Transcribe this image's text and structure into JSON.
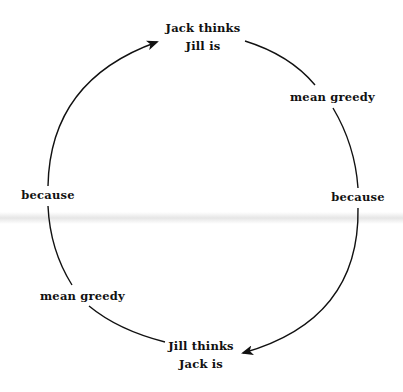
{
  "diagram": {
    "type": "cycle",
    "nodes": {
      "top": {
        "line1": "Jack thinks",
        "line2": "Jill is"
      },
      "bottom": {
        "line1": "Jill thinks",
        "line2": "Jack is"
      }
    },
    "edge_labels": {
      "top_right": "mean greedy",
      "right": "because",
      "bottom_left": "mean greedy",
      "left": "because"
    },
    "arrows": [
      {
        "from": "left",
        "to": "top",
        "direction": "clockwise"
      },
      {
        "from": "right",
        "to": "bottom",
        "direction": "clockwise"
      }
    ],
    "colors": {
      "stroke": "#111111",
      "background": "#ffffff"
    }
  }
}
